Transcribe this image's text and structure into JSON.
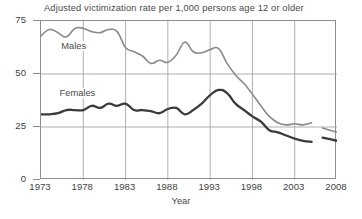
{
  "chart_data": {
    "type": "line",
    "title": "Adjusted victimization rate per 1,000 persons age 12 or older",
    "xlabel": "Year",
    "ylabel": "",
    "xlim": [
      1973,
      2008
    ],
    "ylim": [
      0,
      75
    ],
    "grid": true,
    "legend_position": "inline-labels",
    "x_ticks": [
      "1973",
      "1978",
      "1983",
      "1988",
      "1993",
      "1998",
      "2003",
      "2008"
    ],
    "x_tick_values": [
      1973,
      1978,
      1983,
      1988,
      1993,
      1998,
      2003,
      2008
    ],
    "y_ticks": [
      "0",
      "25",
      "50",
      "75"
    ],
    "y_tick_values": [
      0,
      25,
      50,
      75
    ],
    "x": [
      1973,
      1974,
      1975,
      1976,
      1977,
      1978,
      1979,
      1980,
      1981,
      1982,
      1983,
      1984,
      1985,
      1986,
      1987,
      1988,
      1989,
      1990,
      1991,
      1992,
      1993,
      1994,
      1995,
      1996,
      1997,
      1998,
      1999,
      2000,
      2001,
      2002,
      2003,
      2004,
      2005
    ],
    "series": [
      {
        "name": "Males",
        "color": "#8a8a8a",
        "width": 1.6,
        "label_x": 1975.4,
        "label_y": 62.5,
        "values": [
          68.0,
          71.0,
          69.5,
          67.5,
          71.5,
          71.5,
          70.0,
          69.5,
          71.0,
          70.0,
          62.5,
          60.5,
          58.5,
          55.0,
          56.5,
          55.5,
          59.0,
          65.0,
          60.5,
          60.0,
          61.5,
          62.0,
          55.0,
          49.5,
          45.5,
          40.5,
          35.0,
          30.0,
          27.0,
          26.0,
          26.5,
          26.0,
          27.0
        ],
        "tail_segment": {
          "x": [
            2006.3,
            2008.0
          ],
          "values": [
            24.5,
            22.5
          ]
        }
      },
      {
        "name": "Females",
        "color": "#3c3c3c",
        "width": 2.3,
        "label_x": 1975.2,
        "label_y": 40.0,
        "values": [
          31.0,
          31.0,
          31.5,
          33.0,
          33.0,
          33.0,
          35.0,
          34.0,
          36.0,
          35.0,
          36.0,
          33.0,
          33.0,
          32.5,
          31.5,
          33.5,
          34.0,
          31.0,
          33.0,
          36.0,
          40.0,
          42.5,
          41.0,
          36.0,
          33.0,
          30.0,
          27.5,
          23.5,
          22.5,
          21.0,
          19.5,
          18.5,
          18.0
        ],
        "tail_segment": {
          "x": [
            2006.3,
            2008.0
          ],
          "values": [
            20.0,
            18.5
          ]
        }
      }
    ]
  }
}
